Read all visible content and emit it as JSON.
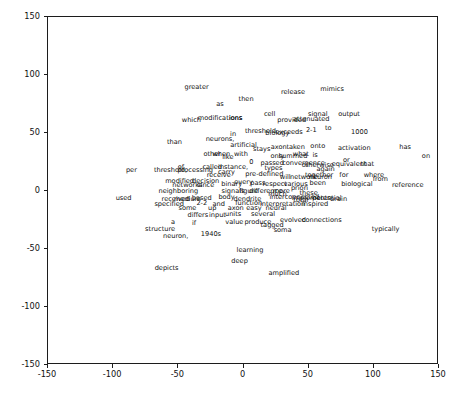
{
  "chart_data": {
    "type": "scatter",
    "title": "",
    "xlabel": "",
    "ylabel": "",
    "xlim": [
      -150,
      150
    ],
    "ylim": [
      -150,
      150
    ],
    "grid": false,
    "legend": null,
    "xticks": [
      -150,
      -100,
      -50,
      0,
      50,
      100,
      150
    ],
    "xticklabels": [
      "-150",
      "-100",
      "-50",
      "0",
      "50",
      "100",
      "150"
    ],
    "yticks": [
      -150,
      -100,
      -50,
      0,
      50,
      100,
      150
    ],
    "yticklabels": [
      "-150",
      "-100",
      "-50",
      "0",
      "50",
      "100",
      "150"
    ],
    "marker": "text",
    "note": "Text-annotation scatter (word embedding projection); each point is rendered as its word label.",
    "points": [
      {
        "label": "greater",
        "x": -36,
        "y": 90
      },
      {
        "label": "then",
        "x": 2,
        "y": 79
      },
      {
        "label": "release",
        "x": 38,
        "y": 85
      },
      {
        "label": "mimics",
        "x": 68,
        "y": 88
      },
      {
        "label": "as",
        "x": -18,
        "y": 75
      },
      {
        "label": "cell",
        "x": 20,
        "y": 66
      },
      {
        "label": "signal",
        "x": 57,
        "y": 66
      },
      {
        "label": "output",
        "x": 81,
        "y": 66
      },
      {
        "label": "attenuated",
        "x": 52,
        "y": 62
      },
      {
        "label": "provided",
        "x": 37,
        "y": 61
      },
      {
        "label": "which",
        "x": -40,
        "y": 61
      },
      {
        "label": "modifications",
        "x": -18,
        "y": 63
      },
      {
        "label": "ions",
        "x": -6,
        "y": 63
      },
      {
        "label": "threshold",
        "x": 13,
        "y": 52
      },
      {
        "label": "biology",
        "x": 26,
        "y": 50
      },
      {
        "label": "exceeds",
        "x": 35,
        "y": 51
      },
      {
        "label": "2-1",
        "x": 52,
        "y": 53
      },
      {
        "label": "to",
        "x": 65,
        "y": 54
      },
      {
        "label": "1000",
        "x": 89,
        "y": 51
      },
      {
        "label": "in",
        "x": -8,
        "y": 49
      },
      {
        "label": "neurons,",
        "x": -18,
        "y": 45
      },
      {
        "label": "than",
        "x": -53,
        "y": 42
      },
      {
        "label": "artificial",
        "x": 0,
        "y": 40
      },
      {
        "label": "stays",
        "x": 14,
        "y": 36
      },
      {
        "label": "axon",
        "x": 27,
        "y": 38
      },
      {
        "label": "taken",
        "x": 40,
        "y": 38
      },
      {
        "label": "onto",
        "x": 57,
        "y": 39
      },
      {
        "label": "activation",
        "x": 85,
        "y": 37
      },
      {
        "label": "has",
        "x": 124,
        "y": 38
      },
      {
        "label": "other",
        "x": -24,
        "y": 32
      },
      {
        "label": "when",
        "x": -17,
        "y": 32
      },
      {
        "label": "like",
        "x": -12,
        "y": 29
      },
      {
        "label": "with",
        "x": -2,
        "y": 32
      },
      {
        "label": "only",
        "x": 26,
        "y": 30
      },
      {
        "label": "summed",
        "x": 38,
        "y": 30
      },
      {
        "label": "what",
        "x": 44,
        "y": 32
      },
      {
        "label": "is",
        "x": 55,
        "y": 31
      },
      {
        "label": "on",
        "x": 140,
        "y": 30
      },
      {
        "label": "0",
        "x": 6,
        "y": 25
      },
      {
        "label": "passed",
        "x": 22,
        "y": 24
      },
      {
        "label": "convergence",
        "x": 46,
        "y": 24
      },
      {
        "label": "or",
        "x": 79,
        "y": 27
      },
      {
        "label": "equivalent",
        "x": 81,
        "y": 23
      },
      {
        "label": "that",
        "x": 95,
        "y": 23
      },
      {
        "label": "of",
        "x": -48,
        "y": 21
      },
      {
        "label": "called",
        "x": -24,
        "y": 21
      },
      {
        "label": "instance,",
        "x": -8,
        "y": 21
      },
      {
        "label": "types",
        "x": 23,
        "y": 20
      },
      {
        "label": "otherwise",
        "x": 57,
        "y": 22
      },
      {
        "label": "again",
        "x": 63,
        "y": 19
      },
      {
        "label": "per",
        "x": -86,
        "y": 18
      },
      {
        "label": "threshold,",
        "x": -56,
        "y": 18
      },
      {
        "label": "processing",
        "x": -37,
        "y": 18
      },
      {
        "label": "carry",
        "x": -13,
        "y": 16
      },
      {
        "label": "receive",
        "x": -19,
        "y": 14
      },
      {
        "label": "pre-defined",
        "x": 16,
        "y": 15
      },
      {
        "label": "together",
        "x": 58,
        "y": 14
      },
      {
        "label": "for",
        "x": 77,
        "y": 14
      },
      {
        "label": "where",
        "x": 100,
        "y": 14
      },
      {
        "label": "will",
        "x": 32,
        "y": 12
      },
      {
        "label": "network",
        "x": 46,
        "y": 12
      },
      {
        "label": "neuron",
        "x": 59,
        "y": 12
      },
      {
        "label": "from",
        "x": 105,
        "y": 10
      },
      {
        "label": "modified",
        "x": -49,
        "y": 9
      },
      {
        "label": "decision",
        "x": -29,
        "y": 9
      },
      {
        "label": "every",
        "x": 0,
        "y": 8
      },
      {
        "label": "binary",
        "x": -9,
        "y": 6
      },
      {
        "label": "pass",
        "x": 11,
        "y": 7
      },
      {
        "label": "respect",
        "x": 24,
        "y": 6
      },
      {
        "label": "various",
        "x": 40,
        "y": 6
      },
      {
        "label": "been",
        "x": 57,
        "y": 7
      },
      {
        "label": "biological",
        "x": 87,
        "y": 6
      },
      {
        "label": "reference",
        "x": 126,
        "y": 5
      },
      {
        "label": "networks",
        "x": -43,
        "y": 5
      },
      {
        "label": "since",
        "x": -29,
        "y": 5
      },
      {
        "label": "priori",
        "x": 43,
        "y": 3
      },
      {
        "label": "neighboring",
        "x": -50,
        "y": 0
      },
      {
        "label": "signals",
        "x": -8,
        "y": 0
      },
      {
        "label": "figure",
        "x": 4,
        "y": 0
      },
      {
        "label": "difference",
        "x": 17,
        "y": 0
      },
      {
        "label": "more",
        "x": 29,
        "y": 0
      },
      {
        "label": "these",
        "x": 50,
        "y": -2
      },
      {
        "label": "much",
        "x": 26,
        "y": -3
      },
      {
        "label": "interconnected",
        "x": 39,
        "y": -5
      },
      {
        "label": "implements",
        "x": 52,
        "y": -6
      },
      {
        "label": "potential",
        "x": 64,
        "y": -6
      },
      {
        "label": "brain",
        "x": 73,
        "y": -7
      },
      {
        "label": "used",
        "x": -92,
        "y": -6
      },
      {
        "label": "received",
        "x": -52,
        "y": -7
      },
      {
        "label": "medium",
        "x": -43,
        "y": -7
      },
      {
        "label": "based",
        "x": -32,
        "y": -6
      },
      {
        "label": "body",
        "x": -13,
        "y": -5
      },
      {
        "label": "dendrite",
        "x": 3,
        "y": -7
      },
      {
        "label": "total",
        "x": 44,
        "y": -8
      },
      {
        "label": "specified",
        "x": -57,
        "y": -11
      },
      {
        "label": "2-2",
        "x": -32,
        "y": -10
      },
      {
        "label": "and",
        "x": -19,
        "y": -11
      },
      {
        "label": "function",
        "x": 4,
        "y": -10
      },
      {
        "label": "interpretation",
        "x": 30,
        "y": -11
      },
      {
        "label": "inspired",
        "x": 55,
        "y": -11
      },
      {
        "label": "some",
        "x": -43,
        "y": -15
      },
      {
        "label": "up",
        "x": -24,
        "y": -15
      },
      {
        "label": "axon",
        "x": -6,
        "y": -15
      },
      {
        "label": "easy",
        "x": 8,
        "y": -15
      },
      {
        "label": "neural",
        "x": 25,
        "y": -15
      },
      {
        "label": "differs",
        "x": -35,
        "y": -21
      },
      {
        "label": "input",
        "x": -20,
        "y": -21
      },
      {
        "label": "units",
        "x": -8,
        "y": -20
      },
      {
        "label": "several",
        "x": 15,
        "y": -20
      },
      {
        "label": "value",
        "x": -7,
        "y": -27
      },
      {
        "label": "produce",
        "x": 11,
        "y": -27
      },
      {
        "label": "evolved",
        "x": 38,
        "y": -25
      },
      {
        "label": "connections",
        "x": 60,
        "y": -25
      },
      {
        "label": "a",
        "x": -54,
        "y": -27
      },
      {
        "label": "if",
        "x": -38,
        "y": -28
      },
      {
        "label": "tagged",
        "x": 22,
        "y": -29
      },
      {
        "label": "structure",
        "x": -64,
        "y": -33
      },
      {
        "label": "soma",
        "x": 30,
        "y": -34
      },
      {
        "label": "typically",
        "x": 109,
        "y": -33
      },
      {
        "label": "neuron,",
        "x": -52,
        "y": -39
      },
      {
        "label": "1940s",
        "x": -25,
        "y": -37
      },
      {
        "label": "learning",
        "x": 5,
        "y": -51
      },
      {
        "label": "deep",
        "x": -3,
        "y": -60
      },
      {
        "label": "depicts",
        "x": -59,
        "y": -66
      },
      {
        "label": "amplified",
        "x": 31,
        "y": -71
      }
    ]
  }
}
